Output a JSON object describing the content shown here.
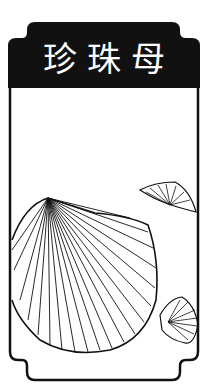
{
  "card": {
    "title": "珍珠母",
    "subject": "mother-of-pearl shell illustration",
    "colors": {
      "frame": "#111111",
      "background": "#ffffff",
      "title_text": "#ffffff"
    }
  }
}
